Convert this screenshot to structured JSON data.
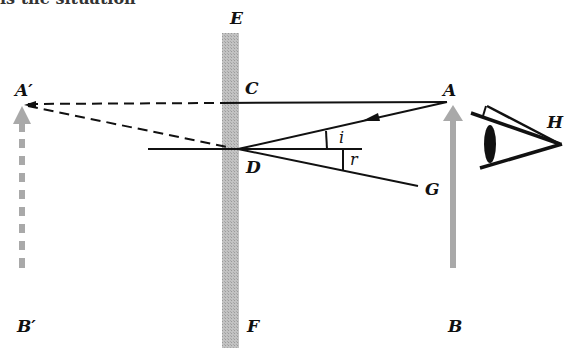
{
  "caption_fragment": "is the situation",
  "colors": {
    "mirror": "#b4b4b4",
    "object_arrow": "#a9a9a9",
    "ray": "#111111",
    "background": "#ffffff"
  },
  "labels": {
    "E": "E",
    "F": "F",
    "A_prime": "A′",
    "B_prime": "B′",
    "A": "A",
    "B": "B",
    "C": "C",
    "D": "D",
    "G": "G",
    "H": "H",
    "i": "i",
    "r": "r"
  },
  "elements": {
    "mirror": "plane mirror EF (vertical)",
    "object": "arrow AB",
    "image": "virtual image arrow A′B′ (dashed)",
    "incident_ray": "A to D",
    "reflected_ray": "D to G",
    "normal": "horizontal normal through D",
    "perpendicular": "A to C (extended dashed to A′)",
    "observer": "eye at H"
  }
}
